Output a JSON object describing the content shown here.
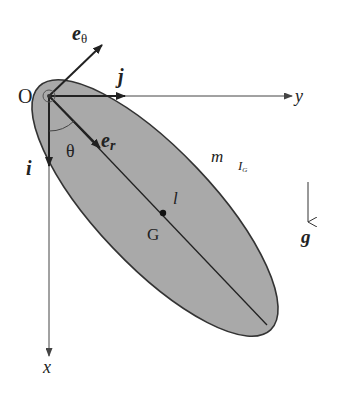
{
  "diagram": {
    "colors": {
      "body_fill": "#a9a9a9",
      "outline": "#333333",
      "axis": "#444444",
      "text": "#222222"
    },
    "labels": {
      "origin": "O",
      "y_axis": "y",
      "x_axis": "x",
      "unit_i": "i",
      "unit_j": "j",
      "e_theta": "e",
      "e_theta_sub": "θ",
      "e_r": "e",
      "e_r_sub": "r",
      "angle": "θ",
      "mass": "m",
      "inertia": "I",
      "inertia_sub": "G",
      "length": "l",
      "center_of_mass": "G",
      "gravity": "g"
    },
    "geometry": {
      "origin": [
        49,
        96
      ],
      "ellipse_center": [
        155,
        208
      ],
      "ellipse_rx": 168,
      "ellipse_ry": 58,
      "ellipse_rotation_deg": 46.5,
      "G_point": [
        163,
        213
      ]
    }
  }
}
